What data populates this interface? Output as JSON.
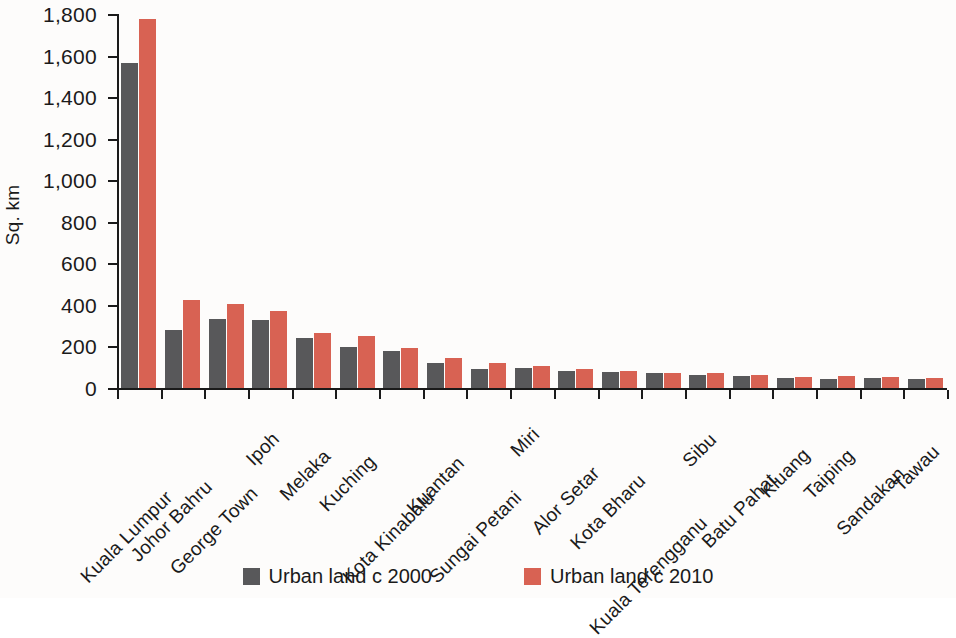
{
  "chart_data": {
    "type": "bar",
    "title": "",
    "xlabel": "",
    "ylabel": "Sq. km",
    "ylim": [
      0,
      1800
    ],
    "yticks": [
      0,
      200,
      400,
      600,
      800,
      1000,
      1200,
      1400,
      1600,
      1800
    ],
    "ytick_labels": [
      "0",
      "200",
      "400",
      "600",
      "800",
      "1,000",
      "1,200",
      "1,400",
      "1,600",
      "1,800"
    ],
    "grid": false,
    "legend_position": "bottom",
    "categories": [
      "Kuala Lumpur",
      "Johor Bahru",
      "George Town",
      "Ipoh",
      "Melaka",
      "Kuching",
      "Kota Kinabalu",
      "Kuantan",
      "Sungai Petani",
      "Miri",
      "Alor Setar",
      "Kota Bharu",
      "Kuala Terengganu",
      "Sibu",
      "Batu Pahat",
      "Kluang",
      "Taiping",
      "Sandakan",
      "Tawau"
    ],
    "series": [
      {
        "name": "Urban land c 2000",
        "color": "#58585a",
        "values": [
          1565,
          278,
          332,
          328,
          240,
          196,
          176,
          122,
          90,
          97,
          80,
          76,
          70,
          62,
          57,
          48,
          43,
          47,
          42
        ]
      },
      {
        "name": "Urban land c 2010",
        "color": "#d86253",
        "values": [
          1775,
          425,
          406,
          370,
          265,
          250,
          192,
          143,
          120,
          108,
          90,
          80,
          74,
          72,
          63,
          55,
          56,
          53,
          48
        ]
      }
    ]
  },
  "legend": {
    "items": [
      {
        "label": "Urban land c 2000"
      },
      {
        "label": "Urban land c 2010"
      }
    ]
  }
}
